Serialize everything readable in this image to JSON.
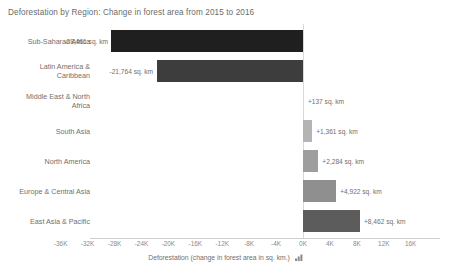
{
  "chart_data": {
    "type": "bar",
    "orientation": "horizontal",
    "title": "Deforestation by Region: Change in forest area from 2015 to 2016",
    "xlabel": "Deforestation (change in forest area in sq. km.)",
    "ylabel": "",
    "xlim": [
      -36000,
      16000
    ],
    "grid": false,
    "legend": "none",
    "unit": "sq. km",
    "categories": [
      "Sub-Saharan Africa",
      "Latin America &\nCaribbean",
      "Middle East & North\nAfrica",
      "South Asia",
      "North America",
      "Europe & Central Asia",
      "East Asia & Pacific"
    ],
    "values": [
      -28461,
      -21764,
      137,
      1361,
      2284,
      4922,
      8462
    ],
    "value_labels": [
      "-28,461 sq. km",
      "-21,764 sq. km",
      "+137 sq. km",
      "+1,361 sq. km",
      "+2,284 sq. km",
      "+4,922 sq. km",
      "+8,462 sq. km"
    ],
    "bar_colors": [
      "#1f1f1f",
      "#3d3d3d",
      "#d9d9d9",
      "#b4b4b4",
      "#9e9e9e",
      "#8f8f8f",
      "#5c5c5c"
    ],
    "xticks": [
      -36000,
      -32000,
      -28000,
      -24000,
      -20000,
      -16000,
      -12000,
      -8000,
      -4000,
      0,
      4000,
      8000,
      12000,
      16000
    ],
    "xtick_labels": [
      "-36K",
      "-32K",
      "-28K",
      "-24K",
      "-20K",
      "-16K",
      "-12K",
      "-8K",
      "-4K",
      "0K",
      "4K",
      "8K",
      "12K",
      "16K"
    ]
  },
  "axis": {
    "sort_icon": "sort-ascending-icon"
  }
}
